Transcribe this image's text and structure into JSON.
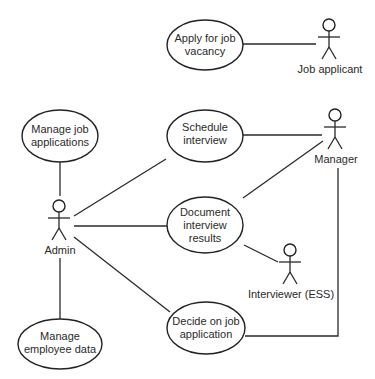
{
  "diagram": {
    "type": "UML use case diagram",
    "actors": [
      {
        "id": "job_applicant",
        "label": "Job applicant",
        "x": 329,
        "y": 25
      },
      {
        "id": "manager",
        "label": "Manager",
        "x": 335,
        "y": 115
      },
      {
        "id": "admin",
        "label": "Admin",
        "x": 59,
        "y": 206
      },
      {
        "id": "interviewer",
        "label": "Interviewer (ESS)",
        "x": 290,
        "y": 250
      }
    ],
    "use_cases": [
      {
        "id": "apply",
        "lines": [
          "Apply for job",
          "vacancy"
        ],
        "cx": 205,
        "cy": 45,
        "rx": 38,
        "ry": 25
      },
      {
        "id": "manage_apps",
        "lines": [
          "Manage job",
          "applications"
        ],
        "cx": 60,
        "cy": 136,
        "rx": 38,
        "ry": 26
      },
      {
        "id": "schedule",
        "lines": [
          "Schedule",
          "interview"
        ],
        "cx": 205,
        "cy": 136,
        "rx": 38,
        "ry": 26
      },
      {
        "id": "document",
        "lines": [
          "Document",
          "interview",
          "results"
        ],
        "cx": 205,
        "cy": 225,
        "rx": 38,
        "ry": 28
      },
      {
        "id": "manage_emp",
        "lines": [
          "Manage",
          "employee data"
        ],
        "cx": 60,
        "cy": 344,
        "rx": 42,
        "ry": 25
      },
      {
        "id": "decide",
        "lines": [
          "Decide on job",
          "application"
        ],
        "cx": 206,
        "cy": 328,
        "rx": 39,
        "ry": 26
      }
    ],
    "associations": [
      [
        "job_applicant",
        "apply"
      ],
      [
        "admin",
        "manage_apps"
      ],
      [
        "admin",
        "schedule"
      ],
      [
        "admin",
        "document"
      ],
      [
        "admin",
        "decide"
      ],
      [
        "admin",
        "manage_emp"
      ],
      [
        "manager",
        "schedule"
      ],
      [
        "manager",
        "document"
      ],
      [
        "manager",
        "decide"
      ],
      [
        "interviewer",
        "document"
      ]
    ]
  }
}
